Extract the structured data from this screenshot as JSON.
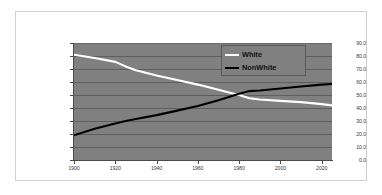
{
  "chart_data": {
    "type": "line",
    "title": "",
    "subtitle": "",
    "xlabel": "",
    "ylabel": "",
    "xlim": [
      1900,
      2025
    ],
    "ylim": [
      0.0,
      90.0
    ],
    "grid": true,
    "legend_position": "top-right",
    "background_color": "#808080",
    "x_ticks": [
      "1900",
      "1920",
      "1940",
      "1960",
      "1980",
      "2000",
      "2020"
    ],
    "x_tick_values": [
      1900,
      1920,
      1940,
      1960,
      1980,
      2000,
      2020
    ],
    "y_ticks": [
      "0.0",
      "10.0",
      "20.0",
      "30.0",
      "40.0",
      "50.0",
      "60.0",
      "70.0",
      "80.0",
      "90.0"
    ],
    "y_tick_values": [
      0.0,
      10.0,
      20.0,
      30.0,
      40.0,
      50.0,
      60.0,
      70.0,
      80.0,
      90.0
    ],
    "x": [
      1900,
      1910,
      1920,
      1925,
      1930,
      1940,
      1950,
      1960,
      1970,
      1975,
      1980,
      1985,
      1990,
      2000,
      2010,
      2020,
      2025
    ],
    "series": [
      {
        "name": "White",
        "color": "#ffffff",
        "values": [
          81.0,
          78.5,
          75.5,
          72.0,
          69.0,
          65.0,
          61.5,
          58.0,
          54.0,
          52.0,
          50.0,
          47.5,
          46.5,
          45.5,
          44.5,
          43.0,
          42.0
        ]
      },
      {
        "name": "NonWhite",
        "color": "#000000",
        "values": [
          19.0,
          24.0,
          28.0,
          30.0,
          31.5,
          34.5,
          38.0,
          41.5,
          46.0,
          48.5,
          51.0,
          53.0,
          53.5,
          55.0,
          56.5,
          58.0,
          58.5
        ]
      }
    ],
    "annotations": []
  },
  "legend": {
    "items": [
      {
        "label": "White",
        "color": "#ffffff"
      },
      {
        "label": "NonWhite",
        "color": "#000000"
      }
    ]
  }
}
